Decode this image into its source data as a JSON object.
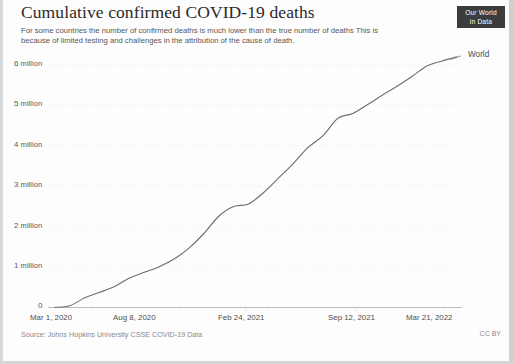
{
  "header": {
    "title": "Cumulative confirmed COVID-19 deaths",
    "subtitle": "For some countries the number of confirmed deaths is much lower than the true number of deaths  This is because of limited testing and challenges in the attribution of the cause of death.",
    "logo_line1": "Our World",
    "logo_line2": "in Data"
  },
  "footer": {
    "source": "Source: Johns Hopkins University CSSE COVID-19 Data",
    "license": "CC BY"
  },
  "axis": {
    "y_ticks": [
      {
        "label": "0",
        "unit": "",
        "value": 0
      },
      {
        "label": "1",
        "unit": "million",
        "value": 1000000
      },
      {
        "label": "2",
        "unit": "million",
        "value": 2000000
      },
      {
        "label": "3",
        "unit": "million",
        "value": 3000000
      },
      {
        "label": "4",
        "unit": "million",
        "value": 4000000
      },
      {
        "label": "5",
        "unit": "million",
        "value": 5000000
      },
      {
        "label": "6",
        "unit": "million",
        "value": 6000000
      }
    ],
    "x_ticks": [
      {
        "label": "Mar 1, 2020"
      },
      {
        "label": "Aug 8, 2020"
      },
      {
        "label": "Feb 24, 2021"
      },
      {
        "label": "Sep 12, 2021"
      },
      {
        "label": "Mar 21, 2022"
      }
    ]
  },
  "series_label": "World",
  "colors": {
    "line": "#6b6b6b",
    "grid": "#e8e8e8",
    "axis": "#bdbdbd",
    "text": "#4d4d4d",
    "logo_bg": "#3a3c3e"
  },
  "chart_data": {
    "type": "line",
    "title": "Cumulative confirmed COVID-19 deaths",
    "subtitle": "For some countries the number of confirmed deaths is much lower than the true number of deaths  This is because of limited testing and challenges in the attribution of the cause of death.",
    "xlabel": "",
    "ylabel": "",
    "ylim": [
      0,
      6400000
    ],
    "grid": true,
    "legend_position": "end-of-line",
    "source": "Johns Hopkins University CSSE COVID-19 Data",
    "xtick_labels": [
      "Mar 1, 2020",
      "Aug 8, 2020",
      "Feb 24, 2021",
      "Sep 12, 2021",
      "Mar 21, 2022"
    ],
    "ytick_labels": [
      "0",
      "1 million",
      "2 million",
      "3 million",
      "4 million",
      "5 million",
      "6 million"
    ],
    "series": [
      {
        "name": "World",
        "x": [
          "2020-03-01",
          "2020-04-01",
          "2020-05-01",
          "2020-06-01",
          "2020-07-01",
          "2020-08-08",
          "2020-09-01",
          "2020-10-01",
          "2020-11-01",
          "2020-12-01",
          "2021-01-01",
          "2021-02-01",
          "2021-02-24",
          "2021-03-01",
          "2021-04-01",
          "2021-05-01",
          "2021-06-01",
          "2021-07-01",
          "2021-08-01",
          "2021-09-12",
          "2021-10-01",
          "2021-11-01",
          "2021-12-01",
          "2022-01-01",
          "2022-02-01",
          "2022-03-01",
          "2022-03-21",
          "2022-04-10"
        ],
        "values": [
          3000,
          45000,
          240000,
          375000,
          520000,
          730000,
          870000,
          1010000,
          1200000,
          1470000,
          1830000,
          2260000,
          2500000,
          2560000,
          2840000,
          3200000,
          3560000,
          3960000,
          4250000,
          4680000,
          4800000,
          5020000,
          5260000,
          5480000,
          5720000,
          5980000,
          6100000,
          6200000
        ]
      }
    ]
  }
}
